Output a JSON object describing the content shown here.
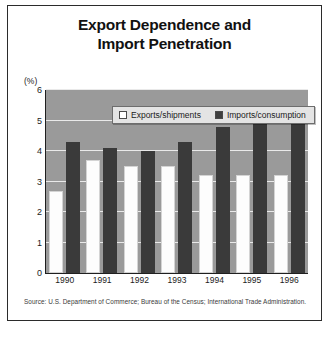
{
  "figure": {
    "title_line1": "Export Dependence and",
    "title_line2": "Import Penetration",
    "source": "Source: U.S. Department of Commerce; Bureau of the Census; International Trade Administration."
  },
  "chart_data": {
    "type": "bar",
    "title": "Export Dependence and Import Penetration",
    "xlabel": "",
    "ylabel": "(%)",
    "ylim": [
      0,
      6
    ],
    "yticks": [
      0,
      1,
      2,
      3,
      4,
      5,
      6
    ],
    "ytick_labels": [
      "0",
      "1",
      "2",
      "3",
      "4",
      "5",
      "6"
    ],
    "grid": true,
    "legend_position": "top-center",
    "categories": [
      "1990",
      "1991",
      "1992",
      "1993",
      "1994",
      "1995",
      "1996"
    ],
    "series": [
      {
        "name": "Exports/shipments",
        "color": "#ffffff",
        "values": [
          2.7,
          3.7,
          3.5,
          3.5,
          3.2,
          3.2,
          3.2
        ]
      },
      {
        "name": "Imports/consumption",
        "color": "#3a3a3a",
        "values": [
          4.3,
          4.1,
          4.0,
          4.3,
          4.8,
          4.9,
          5.25
        ]
      }
    ],
    "plot_background": "#9a9a9a",
    "gridline_color": "#e9e9e9"
  }
}
